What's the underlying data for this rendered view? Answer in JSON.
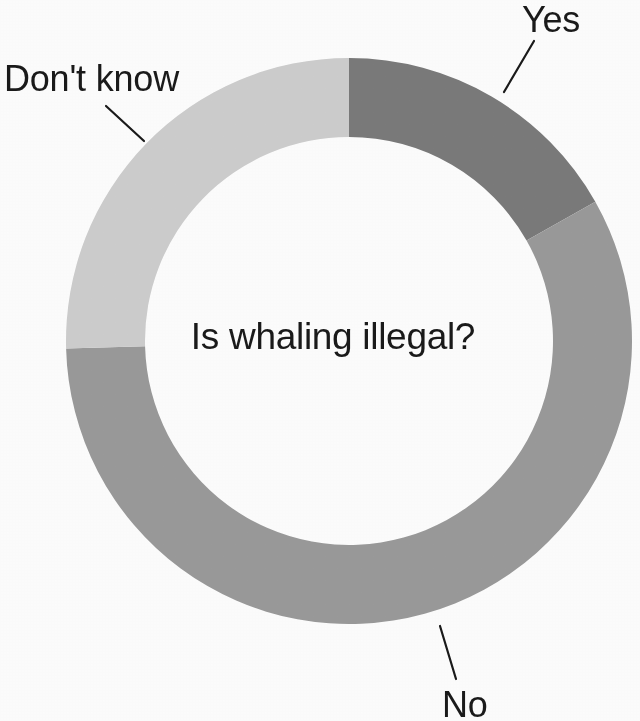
{
  "center_label": "Is whaling illegal?",
  "labels": {
    "yes": "Yes",
    "no": "No",
    "dont_know": "Don't know"
  },
  "chart_data": {
    "type": "pie",
    "variant": "donut",
    "title": "Is whaling illegal?",
    "xlabel": "",
    "ylabel": "",
    "categories": [
      "Yes",
      "No",
      "Don't know"
    ],
    "values": [
      16.8,
      57.8,
      25.4
    ],
    "value_unit": "percent",
    "colors": [
      "#7b7b7b",
      "#9b9b9b",
      "#cfcfcf"
    ],
    "legend": "labels-with-leader-lines",
    "grid": false,
    "start_angle_deg": 0,
    "direction": "clockwise",
    "slices": [
      {
        "name": "Yes",
        "value": 16.8,
        "color": "#7b7b7b",
        "start_angle_deg": 0.0,
        "end_angle_deg": 60.5,
        "label": "Yes"
      },
      {
        "name": "No",
        "value": 57.8,
        "color": "#9b9b9b",
        "start_angle_deg": 60.5,
        "end_angle_deg": 268.5,
        "label": "No"
      },
      {
        "name": "Don't know",
        "value": 25.4,
        "color": "#cfcfcf",
        "start_angle_deg": 268.5,
        "end_angle_deg": 360.0,
        "label": "Don't know"
      }
    ],
    "geometry": {
      "center_x": 349,
      "center_y": 341,
      "outer_radius": 283,
      "inner_radius": 204
    },
    "background_color": "#ffffff",
    "text_color": "#1a1a1a"
  }
}
